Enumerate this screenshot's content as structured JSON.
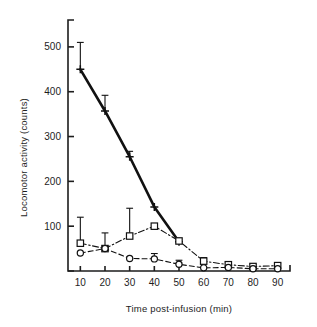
{
  "chart_data": {
    "type": "line",
    "title": "",
    "xlabel": "Time post-infusion (min)",
    "ylabel": "Locomotor activity (counts)",
    "x": [
      10,
      20,
      30,
      40,
      50,
      60,
      70,
      80,
      90
    ],
    "xtick_labels": [
      "10",
      "20",
      "30",
      "40",
      "50",
      "60",
      "70",
      "80",
      "90"
    ],
    "ytick_labels": [
      "100",
      "200",
      "300",
      "400",
      "500"
    ],
    "yticks": [
      100,
      200,
      300,
      400,
      500
    ],
    "xlim": [
      5,
      95
    ],
    "ylim": [
      0,
      560
    ],
    "grid": false,
    "legend": "none",
    "error_bars": "upper only (SEM)",
    "series": [
      {
        "name": "plus-series",
        "marker": "plus",
        "linestyle": "solid",
        "linewidth": "thick",
        "color": "#111111",
        "x": [
          10,
          20,
          30,
          40,
          50
        ],
        "values": [
          450,
          357,
          255,
          143,
          65
        ],
        "error_upper": [
          60,
          35,
          12,
          0,
          0
        ]
      },
      {
        "name": "square-series",
        "marker": "square",
        "linestyle": "dash-dot",
        "linewidth": "thin",
        "color": "#111111",
        "x": [
          10,
          20,
          30,
          40,
          50,
          60,
          70,
          80,
          90
        ],
        "values": [
          62,
          50,
          78,
          100,
          67,
          22,
          14,
          10,
          12
        ],
        "error_upper": [
          58,
          35,
          62,
          0,
          0,
          8,
          6,
          5,
          5
        ]
      },
      {
        "name": "circle-series",
        "marker": "circle",
        "linestyle": "dashed",
        "linewidth": "thin",
        "color": "#111111",
        "x": [
          10,
          20,
          30,
          40,
          50,
          60,
          70,
          80,
          90
        ],
        "values": [
          40,
          50,
          28,
          27,
          15,
          7,
          8,
          5,
          5
        ],
        "error_upper": [
          0,
          0,
          0,
          12,
          9,
          0,
          0,
          0,
          0
        ]
      }
    ]
  },
  "figure": {
    "background_color": "#ffffff",
    "axis_color": "#1d1d1d"
  }
}
